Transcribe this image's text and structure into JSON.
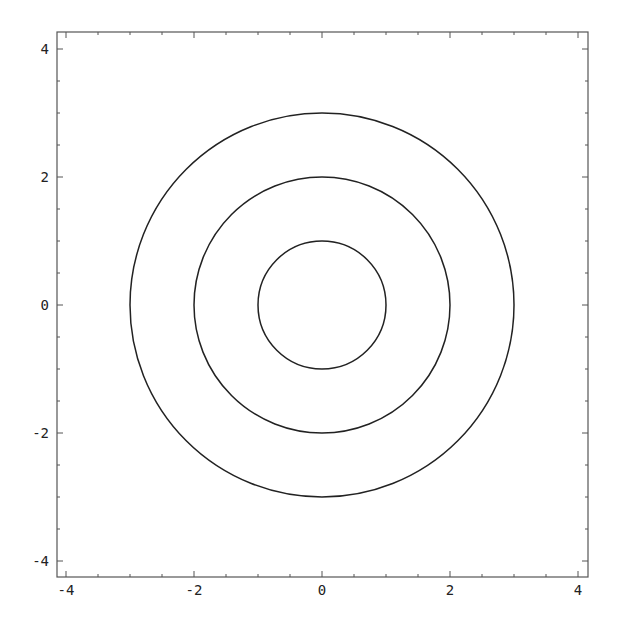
{
  "chart_data": {
    "type": "line",
    "title": "",
    "xlabel": "",
    "ylabel": "",
    "xlim": [
      -4.2,
      4.2
    ],
    "ylim": [
      -4.2,
      4.2
    ],
    "grid": false,
    "legend": null,
    "x_ticks": [
      "-4",
      "-2",
      "0",
      "2",
      "4"
    ],
    "y_ticks": [
      "-4",
      "-2",
      "0",
      "2",
      "4"
    ],
    "series": [
      {
        "name": "circle r=1",
        "shape": "circle",
        "center": [
          0,
          0
        ],
        "radius": 1
      },
      {
        "name": "circle r=2",
        "shape": "circle",
        "center": [
          0,
          0
        ],
        "radius": 2
      },
      {
        "name": "circle r=3",
        "shape": "circle",
        "center": [
          0,
          0
        ],
        "radius": 3
      }
    ],
    "line_color": "#222222",
    "frame_color": "#555555"
  }
}
